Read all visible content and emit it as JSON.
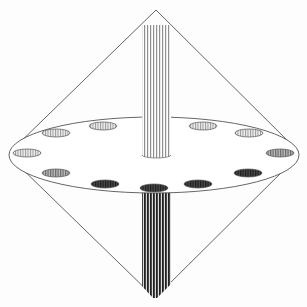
{
  "diagram": {
    "description": "Double cone (bicone) with a central horizontal elliptical disc containing twelve holes and a vertical striped column passing through the axis",
    "colors": {
      "background": "#fdfdfd",
      "outline": "#555555",
      "upper_column_stripes": "#9a9a9a",
      "lower_column_stripes": "#2a2a2a",
      "hole_fill_light": "#d8d8d8",
      "hole_fill_dark": "#3a3a3a"
    },
    "upper_cone": {
      "apex": [
        156,
        10
      ],
      "left_base": [
        9,
        153
      ],
      "right_base": [
        299,
        152
      ]
    },
    "lower_cone": {
      "apex": [
        155,
        298
      ],
      "left_base": [
        9,
        153
      ],
      "right_base": [
        299,
        152
      ]
    },
    "disc": {
      "cx": 154,
      "cy": 155,
      "rx": 145,
      "ry": 38
    },
    "column": {
      "x_left": 142,
      "x_right": 171,
      "top": 25,
      "bottom_visible_upper": 157,
      "lower_start": 190,
      "lower_end": 298
    },
    "holes": [
      {
        "id": "hole-1",
        "cx": 103,
        "cy": 126,
        "rx": 14,
        "ry": 4,
        "tone": "light"
      },
      {
        "id": "hole-2",
        "cx": 203,
        "cy": 126,
        "rx": 14,
        "ry": 4,
        "tone": "light"
      },
      {
        "id": "hole-3",
        "cx": 56,
        "cy": 133,
        "rx": 14,
        "ry": 4,
        "tone": "light"
      },
      {
        "id": "hole-4",
        "cx": 249,
        "cy": 133,
        "rx": 14,
        "ry": 4,
        "tone": "light"
      },
      {
        "id": "hole-5",
        "cx": 27,
        "cy": 153,
        "rx": 14,
        "ry": 4,
        "tone": "light"
      },
      {
        "id": "hole-6",
        "cx": 280,
        "cy": 153,
        "rx": 14,
        "ry": 4,
        "tone": "medium"
      },
      {
        "id": "hole-7",
        "cx": 56,
        "cy": 173,
        "rx": 14,
        "ry": 4,
        "tone": "medium"
      },
      {
        "id": "hole-8",
        "cx": 248,
        "cy": 173,
        "rx": 14,
        "ry": 4,
        "tone": "dark"
      },
      {
        "id": "hole-9",
        "cx": 105,
        "cy": 184,
        "rx": 14,
        "ry": 4,
        "tone": "dark"
      },
      {
        "id": "hole-10",
        "cx": 154,
        "cy": 188,
        "rx": 14,
        "ry": 4,
        "tone": "dark"
      },
      {
        "id": "hole-11",
        "cx": 198,
        "cy": 184,
        "rx": 14,
        "ry": 4,
        "tone": "dark"
      }
    ]
  }
}
